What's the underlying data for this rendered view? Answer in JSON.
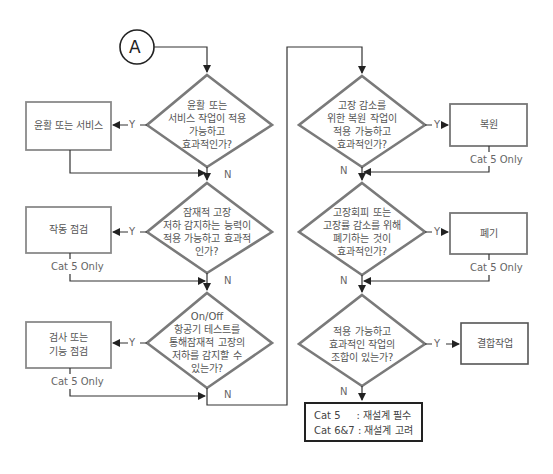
{
  "colors": {
    "diamond_stroke": "#7a7a7a",
    "box_stroke": "#8a8a8a",
    "line": "#333333",
    "final_box_stroke": "#222222",
    "text": "#555555"
  },
  "start_connector": {
    "label": "A"
  },
  "left_column": {
    "decisions": [
      {
        "text": "윤활 또는\n서비스 작업이 적용\n가능하고\n효과적인가?",
        "yes_label": "Y",
        "no_label": "N"
      },
      {
        "text": "잠재적 고장\n저하 감지하는 능력이\n적용 가능하고 효과적\n인가?",
        "yes_label": "Y",
        "no_label": "N"
      },
      {
        "text": "On/Off\n항공기 테스트를\n통해잠재적 고장의\n저하를 감지할 수\n있는가?",
        "yes_label": "Y",
        "no_label": "N"
      }
    ],
    "actions": [
      {
        "text": "윤활 또는 서비스",
        "note": ""
      },
      {
        "text": "작동 점검",
        "note": "Cat 5 Only"
      },
      {
        "text": "검사 또는\n기능 점검",
        "note": "Cat 5 Only"
      }
    ]
  },
  "right_column": {
    "decisions": [
      {
        "text": "고장 감소를\n위한 복원 작업이\n적용 가능하고\n효과적인가?",
        "yes_label": "Y",
        "no_label": "N"
      },
      {
        "text": "고장회피 또는\n고장률 감소를 위해\n폐기하는 것이\n효과적인가?",
        "yes_label": "Y",
        "no_label": "N"
      },
      {
        "text": "적용 가능하고\n효과적인 작업의\n조합이 있는가?",
        "yes_label": "Y",
        "no_label": "N"
      }
    ],
    "actions": [
      {
        "text": "복원",
        "note": "Cat 5 Only"
      },
      {
        "text": "폐기",
        "note": "Cat 5 Only"
      },
      {
        "text": "결합작업",
        "note": ""
      }
    ]
  },
  "final_box": {
    "rows": [
      "Cat 5     : 재설계 필수",
      "Cat 6&7 : 재설계 고려"
    ]
  },
  "caption": "(figure caption — cut off at bottom edge)"
}
